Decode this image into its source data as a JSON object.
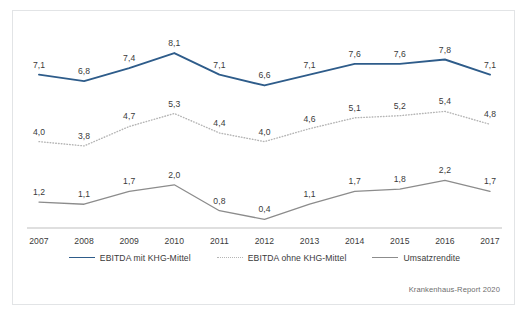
{
  "chart_data": {
    "type": "line",
    "title": "",
    "subtitle": "",
    "xlabel": "",
    "ylabel": "",
    "categories": [
      "2007",
      "2008",
      "2009",
      "2010",
      "2011",
      "2012",
      "2013",
      "2014",
      "2015",
      "2016",
      "2017"
    ],
    "ylim": [
      0,
      9
    ],
    "grid": false,
    "legend_position": "bottom",
    "series": [
      {
        "name": "EBITDA mit KHG-Mittel",
        "color": "#2e5c8a",
        "style": "solid",
        "values": [
          7.1,
          6.8,
          7.4,
          8.1,
          7.1,
          6.6,
          7.1,
          7.6,
          7.6,
          7.8,
          7.1
        ],
        "labels": [
          "7,1",
          "6,8",
          "7,4",
          "8,1",
          "7,1",
          "6,6",
          "7,1",
          "7,6",
          "7,6",
          "7,8",
          "7,1"
        ]
      },
      {
        "name": "EBITDA ohne KHG-Mittel",
        "color": "#b5b5b5",
        "style": "dotted",
        "values": [
          4.0,
          3.8,
          4.7,
          5.3,
          4.4,
          4.0,
          4.6,
          5.1,
          5.2,
          5.4,
          4.8
        ],
        "labels": [
          "4,0",
          "3,8",
          "4,7",
          "5,3",
          "4,4",
          "4,0",
          "4,6",
          "5,1",
          "5,2",
          "5,4",
          "4,8"
        ]
      },
      {
        "name": "Umsatzrendite",
        "color": "#8c8c8c",
        "style": "solid",
        "values": [
          1.2,
          1.1,
          1.7,
          2.0,
          0.8,
          0.4,
          1.1,
          1.7,
          1.8,
          2.2,
          1.7
        ],
        "labels": [
          "1,2",
          "1,1",
          "1,7",
          "2,0",
          "0,8",
          "0,4",
          "1,1",
          "1,7",
          "1,8",
          "2,2",
          "1,7"
        ]
      }
    ],
    "axis_color": "#bfbfbf",
    "frame_color": "#e2e4e6"
  },
  "source_note": "Krankenhaus-Report 2020"
}
